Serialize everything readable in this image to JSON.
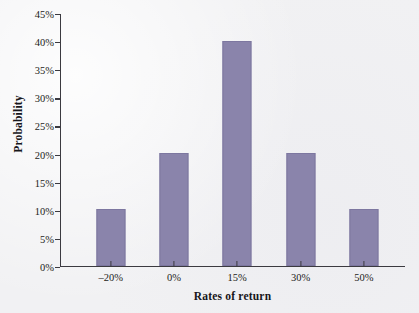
{
  "chart_data": {
    "type": "bar",
    "title": "",
    "subtitle": "",
    "xlabel": "Rates of return",
    "ylabel": "Probability",
    "categories": [
      "–20%",
      "0%",
      "15%",
      "30%",
      "50%"
    ],
    "values": [
      10,
      20,
      40,
      20,
      10
    ],
    "value_unit": "%",
    "ylim": [
      0,
      45
    ],
    "ytick_values": [
      0,
      5,
      10,
      15,
      20,
      25,
      30,
      35,
      40,
      45
    ],
    "ytick_labels": [
      "0%",
      "5%",
      "10%",
      "15%",
      "20%",
      "25%",
      "30%",
      "35%",
      "40%",
      "45%"
    ],
    "grid": false,
    "legend": null,
    "legend_position": "none",
    "series": [
      {
        "name": "Probability",
        "values": [
          10,
          20,
          40,
          20,
          10
        ]
      }
    ],
    "colors": {
      "bar_fill": "#8a84ab",
      "bar_edge": "#7d77a0",
      "axis": "#3b3a40",
      "text": "#1d1c20",
      "background": "#f1f1f3"
    }
  }
}
